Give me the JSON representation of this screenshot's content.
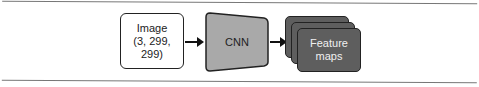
{
  "diagram": {
    "input": {
      "line1": "Image",
      "line2": "(3, 299, 299)"
    },
    "model": {
      "label": "CNN"
    },
    "output": {
      "line1": "Feature",
      "line2": "maps"
    }
  },
  "colors": {
    "input_fill": "#ffffff",
    "cnn_fill": "#a9a9a9",
    "feature_maps_fill": "#5e5e5e",
    "stroke": "#222222"
  }
}
